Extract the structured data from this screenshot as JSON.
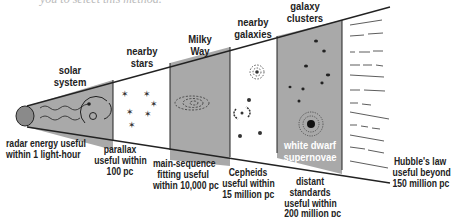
{
  "cut_text": "you to select this method.",
  "regions": [
    {
      "top_label": [
        "solar",
        "system"
      ],
      "bottom_label": [
        "radar energy useful",
        "within 1 light-hour"
      ],
      "shade": "gray"
    },
    {
      "top_label": [
        "nearby",
        "stars"
      ],
      "bottom_label": [
        "parallax",
        "useful within",
        "100 pc"
      ],
      "shade": "white"
    },
    {
      "top_label": [
        "Milky",
        "Way"
      ],
      "bottom_label": [
        "main-sequence",
        "fitting useful",
        "within 10,000 pc"
      ],
      "shade": "gray"
    },
    {
      "top_label": [
        "nearby",
        "galaxies"
      ],
      "bottom_label": [
        "Cepheids",
        "useful within",
        "15 million pc"
      ],
      "shade": "white"
    },
    {
      "top_label": [
        "galaxy",
        "clusters"
      ],
      "bottom_label": [
        "distant",
        "standards",
        "useful within",
        "200 million pc"
      ],
      "shade": "gray",
      "inner_label": [
        "white dwarf",
        "supernovae"
      ]
    },
    {
      "top_label": [],
      "bottom_label": [
        "Hubble's law",
        "useful beyond",
        "150 million pc"
      ],
      "shade": "lines"
    }
  ],
  "colors": {
    "gray": "#a9a9a9",
    "line": "#222222",
    "white": "#ffffff"
  }
}
